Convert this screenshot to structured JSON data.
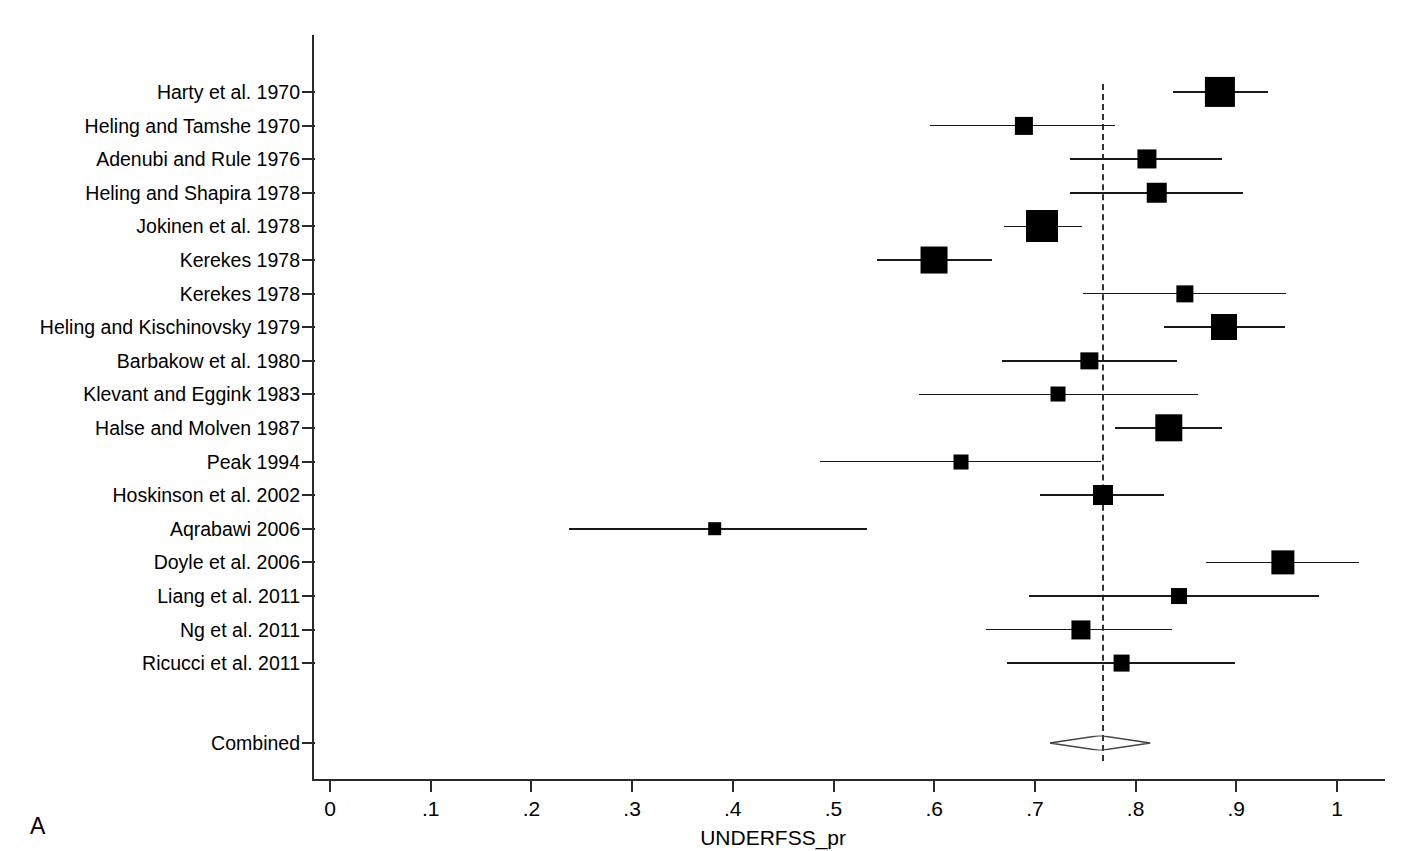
{
  "chart_data": {
    "type": "forest",
    "title": "",
    "xlabel": "UNDERFSS_pr",
    "ylabel": "",
    "panel_letter": "A",
    "xlim": [
      -0.03,
      1.05
    ],
    "xticks": [
      0,
      0.1,
      0.2,
      0.3,
      0.4,
      0.5,
      0.6,
      0.7,
      0.8,
      0.9,
      1
    ],
    "xticklabels": [
      "0",
      ".1",
      ".2",
      ".3",
      ".4",
      ".5",
      ".6",
      ".7",
      ".8",
      ".9",
      "1"
    ],
    "grid": false,
    "legend": "none",
    "reference_line": 0.768,
    "studies": [
      {
        "label": "Harty et al. 1970",
        "estimate": 0.884,
        "ci_low": 0.837,
        "ci_high": 0.931,
        "weight": 0.92
      },
      {
        "label": "Heling and Tamshe 1970",
        "estimate": 0.689,
        "ci_low": 0.596,
        "ci_high": 0.78,
        "weight": 0.4
      },
      {
        "label": "Adenubi and Rule 1976",
        "estimate": 0.811,
        "ci_low": 0.735,
        "ci_high": 0.886,
        "weight": 0.44
      },
      {
        "label": "Heling and Shapira 1978",
        "estimate": 0.821,
        "ci_low": 0.735,
        "ci_high": 0.907,
        "weight": 0.5
      },
      {
        "label": "Jokinen et al. 1978",
        "estimate": 0.707,
        "ci_low": 0.669,
        "ci_high": 0.747,
        "weight": 1.0
      },
      {
        "label": "Kerekes 1978",
        "estimate": 0.6,
        "ci_low": 0.543,
        "ci_high": 0.657,
        "weight": 0.78
      },
      {
        "label": "Kerekes 1978",
        "estimate": 0.849,
        "ci_low": 0.748,
        "ci_high": 0.949,
        "weight": 0.36
      },
      {
        "label": "Heling and Kischinovsky 1979",
        "estimate": 0.888,
        "ci_low": 0.828,
        "ci_high": 0.948,
        "weight": 0.74
      },
      {
        "label": "Barbakow et al. 1980",
        "estimate": 0.754,
        "ci_low": 0.667,
        "ci_high": 0.841,
        "weight": 0.36
      },
      {
        "label": "Klevant and Eggink 1983",
        "estimate": 0.723,
        "ci_low": 0.585,
        "ci_high": 0.862,
        "weight": 0.26
      },
      {
        "label": "Halse and Molven 1987",
        "estimate": 0.833,
        "ci_low": 0.78,
        "ci_high": 0.886,
        "weight": 0.8
      },
      {
        "label": "Peak 1994",
        "estimate": 0.627,
        "ci_low": 0.487,
        "ci_high": 0.766,
        "weight": 0.26
      },
      {
        "label": "Hoskinson et al. 2002",
        "estimate": 0.768,
        "ci_low": 0.705,
        "ci_high": 0.828,
        "weight": 0.48
      },
      {
        "label": "Aqrabawi 2006",
        "estimate": 0.382,
        "ci_low": 0.237,
        "ci_high": 0.533,
        "weight": 0.2
      },
      {
        "label": "Doyle et al. 2006",
        "estimate": 0.946,
        "ci_low": 0.87,
        "ci_high": 1.022,
        "weight": 0.62
      },
      {
        "label": "Liang et al. 2011",
        "estimate": 0.843,
        "ci_low": 0.694,
        "ci_high": 0.982,
        "weight": 0.3
      },
      {
        "label": "Ng et al. 2011",
        "estimate": 0.746,
        "ci_low": 0.651,
        "ci_high": 0.836,
        "weight": 0.44
      },
      {
        "label": "Ricucci et al. 2011",
        "estimate": 0.786,
        "ci_low": 0.672,
        "ci_high": 0.899,
        "weight": 0.34
      }
    ],
    "combined": {
      "label": "Combined",
      "estimate": 0.765,
      "ci_low": 0.715,
      "ci_high": 0.815
    }
  }
}
